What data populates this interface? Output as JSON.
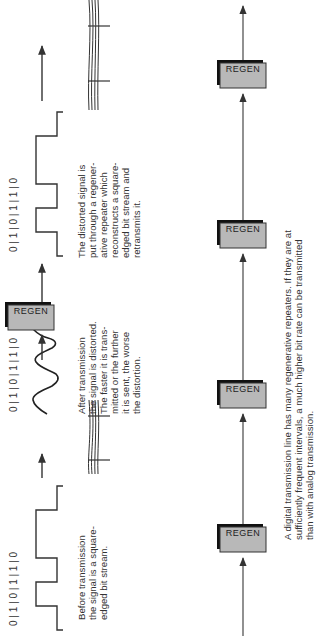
{
  "figure": {
    "orientation": "rotated -90 degrees (text reads bottom-to-top)",
    "top_row": {
      "stages": [
        {
          "name": "before-transmission",
          "bit_labels": [
            "0",
            "1",
            "0",
            "1",
            "1",
            "0"
          ],
          "waveform": "square",
          "caption": "Before transmission\nthe signal is a square-\nedged bit stream."
        },
        {
          "name": "after-transmission",
          "bit_labels": [
            "0",
            "1",
            "0",
            "1",
            "1",
            "0"
          ],
          "waveform": "distorted",
          "caption": "After transmission\nthe signal is distorted.\nThe faster it is trans-\nmitted or the further\nit is sent, the worse\nthe distortion."
        },
        {
          "name": "regenerated",
          "bit_labels": [
            "0",
            "1",
            "0",
            "1",
            "1",
            "0"
          ],
          "waveform": "square",
          "caption": "The distorted signal is\nput through a regener-\native repeater which\nreconstructs a square-\nedged bit stream and\nretransmits it."
        }
      ],
      "regen_label": "REGEN"
    },
    "bottom_row": {
      "repeaters": [
        "REGEN",
        "REGEN",
        "REGEN",
        "REGEN"
      ],
      "caption": "A digital transmission line has many regenerative repeaters. If they are at\nsufficiently frequent intervals, a much higher bit rate can be transmitted\nthan with analog transmission."
    },
    "colors": {
      "line": "#333333",
      "regen_fill": "#b8b8b8",
      "regen_shadow": "#111111",
      "text": "#333333"
    }
  }
}
